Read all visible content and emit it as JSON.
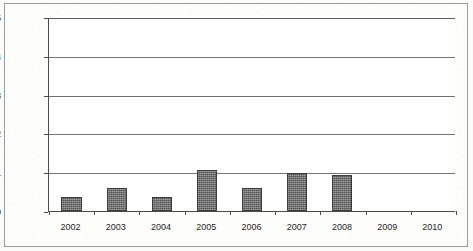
{
  "chart_data": {
    "type": "bar",
    "title": "",
    "xlabel": "",
    "ylabel": "Reduction in MMBtu/ksf",
    "categories": [
      "2002",
      "2003",
      "2004",
      "2005",
      "2006",
      "2007",
      "2008",
      "2009",
      "2010"
    ],
    "values": [
      0.35,
      0.6,
      0.35,
      1.05,
      0.6,
      0.98,
      0.93,
      0,
      0
    ],
    "ylim": [
      0,
      5
    ],
    "y_ticks": [
      0,
      1,
      2,
      3,
      4,
      5
    ],
    "y_tick_labels": [
      "0",
      "1",
      "2",
      "3",
      "4",
      "5"
    ],
    "grid": "horizontal",
    "legend": "none",
    "series_name": "Reduction in MMBtu/ksf",
    "bar_color": "#6d6d6d",
    "bar_edge_color": "#3c3c3c",
    "gridline_color": "#737373",
    "axis_color": "#4c4c4c",
    "plot_background": "#ffffff"
  }
}
